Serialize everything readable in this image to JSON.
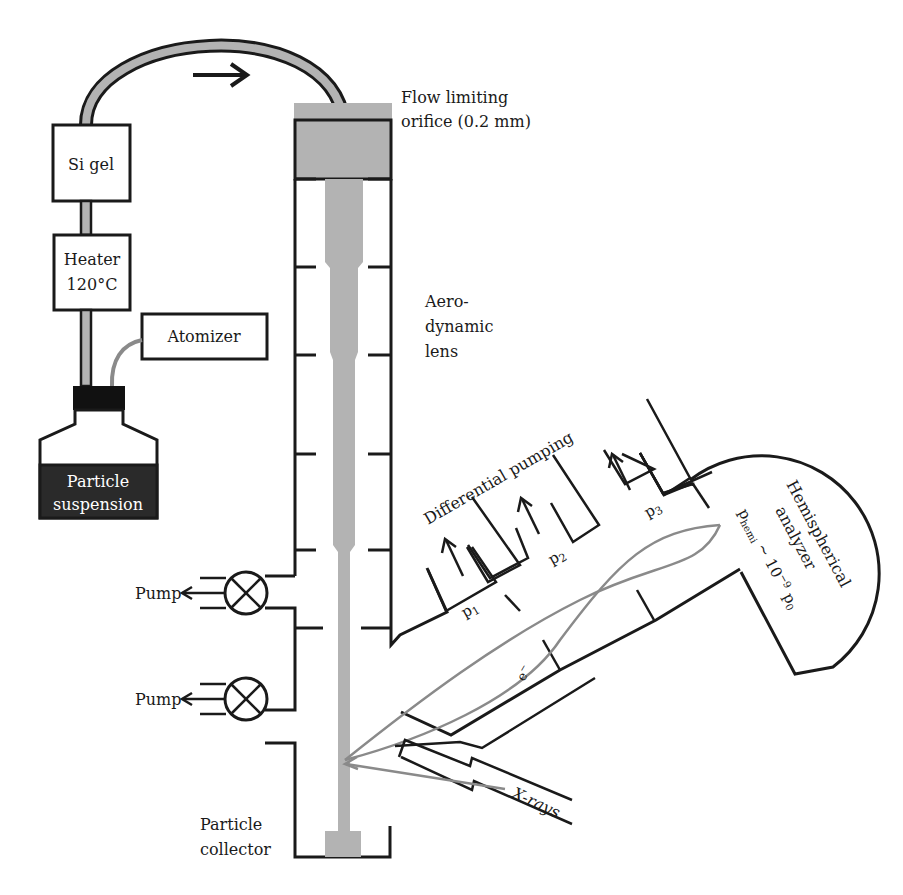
{
  "diagram": {
    "type": "apparatus-schematic",
    "components": {
      "si_gel": {
        "label": "Si gel"
      },
      "heater": {
        "line1": "Heater",
        "line2": "120°C"
      },
      "atomizer": {
        "label": "Atomizer"
      },
      "particle_suspension": {
        "line1": "Particle",
        "line2": "suspension"
      },
      "flow_orifice": {
        "line1": "Flow limiting",
        "line2": "orifice (0.2 mm)"
      },
      "aerodynamic_lens": {
        "line1": "Aero-",
        "line2": "dynamic",
        "line3": "lens"
      },
      "pumps": [
        {
          "label": "Pump"
        },
        {
          "label": "Pump"
        }
      ],
      "particle_collector": {
        "line1": "Particle",
        "line2": "collector"
      },
      "differential_pumping": {
        "label": "Differential pumping"
      },
      "stages": [
        {
          "label": "p",
          "subscript": "1"
        },
        {
          "label": "p",
          "subscript": "2"
        },
        {
          "label": "p",
          "subscript": "3"
        }
      ],
      "electron": {
        "label": "e",
        "superscript": "−"
      },
      "analyzer": {
        "line1": "Hemispherical",
        "line2": "analyzer",
        "pressure_prefix": "p",
        "pressure_subscript": "hemi",
        "pressure_mid": " ~ 10",
        "pressure_exp": "−9",
        "pressure_suffix": " p",
        "pressure_suffix_sub": "0"
      },
      "xrays": {
        "label": "X-rays"
      }
    },
    "colors": {
      "line": "#1a1a1a",
      "beam": "#b3b3b3",
      "trajectory": "#8a8a8a",
      "suspension_fill": "#2a2a2a"
    }
  }
}
